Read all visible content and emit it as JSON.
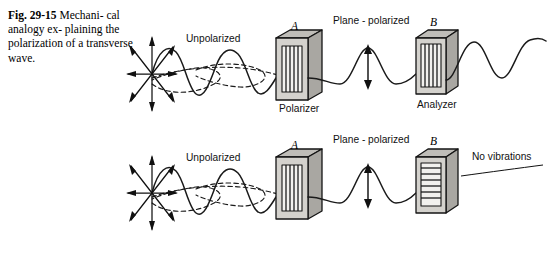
{
  "figure": {
    "number": "Fig. 29-15",
    "caption_rest": "Mechanical analogy explaining the polarization of a transverse wave.",
    "caption_line1": "Mechani-",
    "caption_line2": "cal analogy ex-",
    "caption_line3": "plaining the",
    "caption_line4": "polarization of a",
    "caption_line5": "transverse wave."
  },
  "colors": {
    "ink": "#111111",
    "face_gray": "#d4d2cd",
    "side_gray": "#a9a7a2",
    "top_gray": "#bfbdb8",
    "window": "#f2f1ee",
    "background": "#ffffff"
  },
  "rows": [
    {
      "id": "top-row",
      "labels": {
        "unpolarized": "Unpolarized",
        "plane_polarized": "Plane - polarized",
        "polarizer_letter": "A",
        "polarizer_name": "Polarizer",
        "analyzer_letter": "B",
        "analyzer_name": "Analyzer"
      },
      "polarizer_slats": "vertical",
      "analyzer_slats": "vertical",
      "wave_transmitted": "yes",
      "outcome": "wave passes through analyzer"
    },
    {
      "id": "bottom-row",
      "labels": {
        "unpolarized": "Unpolarized",
        "plane_polarized": "Plane - polarized",
        "polarizer_letter": "A",
        "polarizer_name": "",
        "analyzer_letter": "B",
        "analyzer_name": "",
        "no_vibrations": "No vibrations"
      },
      "polarizer_slats": "vertical",
      "analyzer_slats": "horizontal",
      "wave_transmitted": "no",
      "outcome": "wave blocked by analyzer"
    }
  ],
  "icons": {
    "burst": "radial-vibration-burst-icon",
    "vertical_arrow": "vertical-double-arrow-icon",
    "polarizer_box": "polarizer-grid-icon",
    "analyzer_box": "analyzer-grid-icon"
  }
}
